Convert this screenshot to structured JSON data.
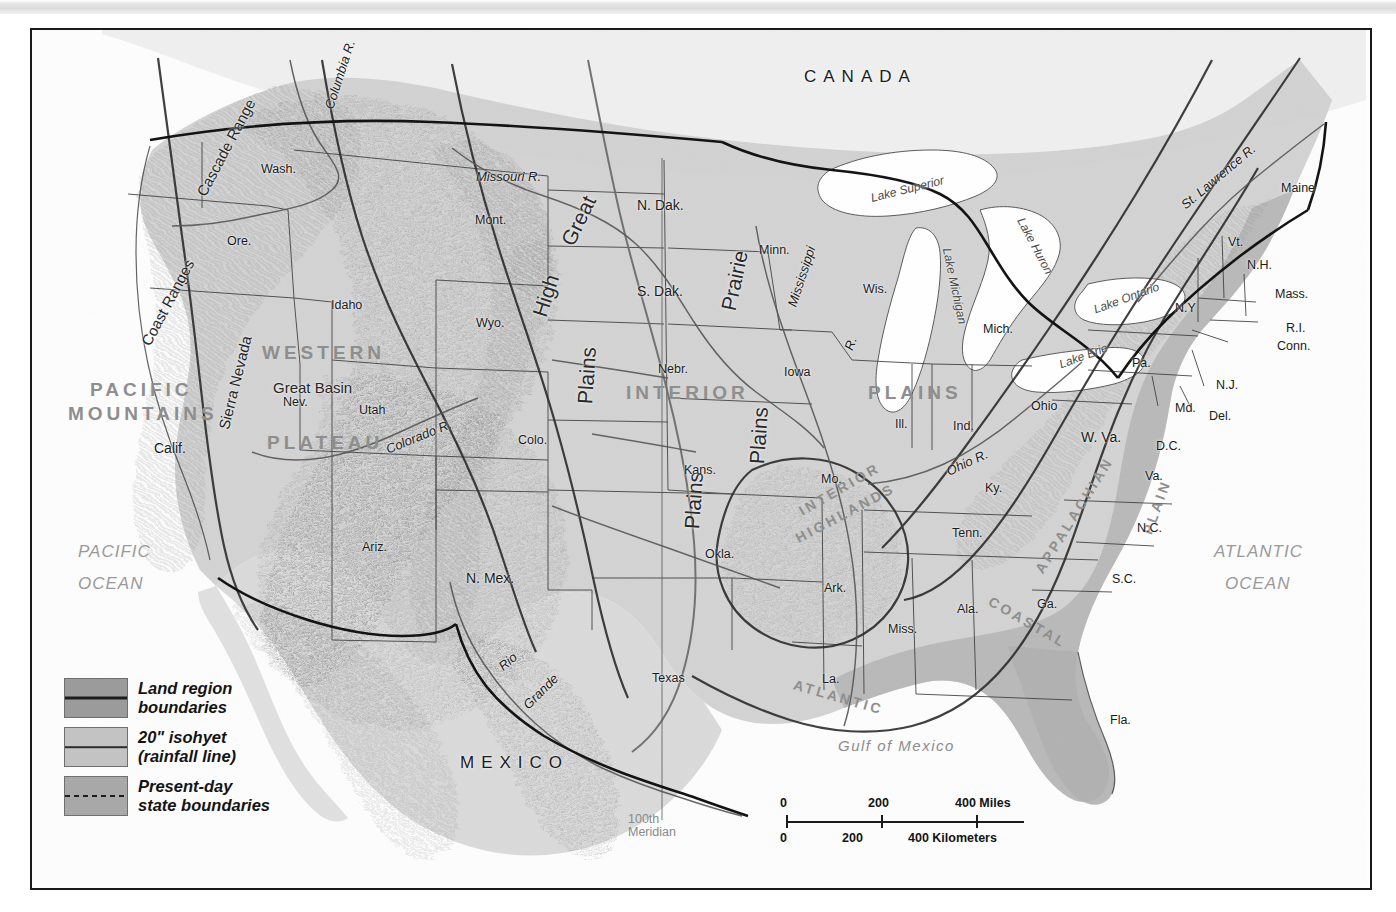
{
  "map": {
    "title": "Physical and Political Map of the United States",
    "countries": [
      {
        "name": "CANADA",
        "x": 772,
        "y": 38
      },
      {
        "name": "MEXICO",
        "x": 428,
        "y": 724
      }
    ],
    "oceans": [
      {
        "name": "PACIFIC",
        "x": 46,
        "y": 513
      },
      {
        "name": "OCEAN",
        "x": 46,
        "y": 545
      },
      {
        "name": "ATLANTIC",
        "x": 1182,
        "y": 513
      },
      {
        "name": "OCEAN",
        "x": 1193,
        "y": 545
      }
    ],
    "gulf": {
      "name": "Gulf of Mexico",
      "x": 806,
      "y": 708
    },
    "land_regions": [
      {
        "name": "PACIFIC",
        "x": 58,
        "y": 350
      },
      {
        "name": "MOUNTAINS",
        "x": 36,
        "y": 374
      },
      {
        "name": "WESTERN",
        "x": 230,
        "y": 313
      },
      {
        "name": "PLATEAU",
        "x": 235,
        "y": 403
      },
      {
        "name": "INTERIOR",
        "x": 594,
        "y": 353
      },
      {
        "name": "PLAINS",
        "x": 836,
        "y": 353
      },
      {
        "name": "INTERIOR",
        "x": 762,
        "y": 452
      },
      {
        "name": "HIGHLANDS",
        "x": 758,
        "y": 476
      },
      {
        "name": "APPALACHIAN",
        "x": 975,
        "y": 478
      },
      {
        "name": "ATLANTIC",
        "x": 760,
        "y": 660
      },
      {
        "name": "COASTAL",
        "x": 952,
        "y": 585
      },
      {
        "name": "PLAIN",
        "x": 1096,
        "y": 470
      }
    ],
    "physical_features": [
      {
        "name": "Great Basin",
        "x": 241,
        "y": 350
      },
      {
        "name": "Coast Ranges",
        "x": 88,
        "y": 265
      },
      {
        "name": "Cascade Range",
        "x": 140,
        "y": 110
      },
      {
        "name": "Sierra Nevada",
        "x": 155,
        "y": 345
      },
      {
        "name": "High",
        "x": 492,
        "y": 255
      },
      {
        "name": "Great",
        "x": 520,
        "y": 180
      },
      {
        "name": "Prairie",
        "x": 672,
        "y": 240
      },
      {
        "name": "Plains",
        "x": 526,
        "y": 335
      },
      {
        "name": "Plains",
        "x": 698,
        "y": 395
      },
      {
        "name": "Plains",
        "x": 633,
        "y": 460
      }
    ],
    "rivers": [
      {
        "name": "Columbia R.",
        "x": 272,
        "y": 38
      },
      {
        "name": "Missouri R.",
        "x": 444,
        "y": 140
      },
      {
        "name": "Mississippi",
        "x": 738,
        "y": 240
      },
      {
        "name": "R.",
        "x": 812,
        "y": 307
      },
      {
        "name": "Ohio R.",
        "x": 913,
        "y": 426
      },
      {
        "name": "Colorado R.",
        "x": 352,
        "y": 400
      },
      {
        "name": "Rio",
        "x": 466,
        "y": 625
      },
      {
        "name": "Grande",
        "x": 487,
        "y": 655
      },
      {
        "name": "St. Lawrence R.",
        "x": 1140,
        "y": 140
      }
    ],
    "lakes": [
      {
        "name": "Lake Superior",
        "x": 838,
        "y": 153
      },
      {
        "name": "Lake Michigan",
        "x": 884,
        "y": 250
      },
      {
        "name": "Lake Huron",
        "x": 972,
        "y": 210
      },
      {
        "name": "Lake Erie",
        "x": 1026,
        "y": 320
      },
      {
        "name": "Lake Ontario",
        "x": 1060,
        "y": 262
      }
    ],
    "states": [
      {
        "name": "Wash.",
        "x": 229,
        "y": 133
      },
      {
        "name": "Ore.",
        "x": 195,
        "y": 205
      },
      {
        "name": "Calif.",
        "x": 122,
        "y": 411
      },
      {
        "name": "Idaho",
        "x": 299,
        "y": 269
      },
      {
        "name": "Mont.",
        "x": 443,
        "y": 184
      },
      {
        "name": "Wyo.",
        "x": 444,
        "y": 287
      },
      {
        "name": "Nev.",
        "x": 251,
        "y": 366
      },
      {
        "name": "Utah",
        "x": 327,
        "y": 374
      },
      {
        "name": "Ariz.",
        "x": 330,
        "y": 511
      },
      {
        "name": "N. Mex.",
        "x": 434,
        "y": 541
      },
      {
        "name": "Colo.",
        "x": 486,
        "y": 404
      },
      {
        "name": "N. Dak.",
        "x": 605,
        "y": 168
      },
      {
        "name": "S. Dak.",
        "x": 605,
        "y": 254
      },
      {
        "name": "Nebr.",
        "x": 626,
        "y": 333
      },
      {
        "name": "Kans.",
        "x": 652,
        "y": 434
      },
      {
        "name": "Okla.",
        "x": 673,
        "y": 518
      },
      {
        "name": "Texas",
        "x": 620,
        "y": 642
      },
      {
        "name": "Minn.",
        "x": 727,
        "y": 214
      },
      {
        "name": "Iowa",
        "x": 752,
        "y": 336
      },
      {
        "name": "Mo.",
        "x": 789,
        "y": 443
      },
      {
        "name": "Ark.",
        "x": 792,
        "y": 552
      },
      {
        "name": "La.",
        "x": 790,
        "y": 643
      },
      {
        "name": "Wis.",
        "x": 831,
        "y": 253
      },
      {
        "name": "Ill.",
        "x": 863,
        "y": 388
      },
      {
        "name": "Miss.",
        "x": 856,
        "y": 593
      },
      {
        "name": "Mich.",
        "x": 951,
        "y": 293
      },
      {
        "name": "Ind.",
        "x": 921,
        "y": 390
      },
      {
        "name": "Ohio",
        "x": 999,
        "y": 370
      },
      {
        "name": "Ky.",
        "x": 953,
        "y": 452
      },
      {
        "name": "Tenn.",
        "x": 920,
        "y": 497
      },
      {
        "name": "Ala.",
        "x": 925,
        "y": 573
      },
      {
        "name": "Ga.",
        "x": 1005,
        "y": 568
      },
      {
        "name": "Fla.",
        "x": 1078,
        "y": 684
      },
      {
        "name": "S.C.",
        "x": 1080,
        "y": 543
      },
      {
        "name": "N.C.",
        "x": 1105,
        "y": 492
      },
      {
        "name": "Va.",
        "x": 1113,
        "y": 440
      },
      {
        "name": "W. Va.",
        "x": 1049,
        "y": 400
      },
      {
        "name": "D.C.",
        "x": 1124,
        "y": 410
      },
      {
        "name": "Md.",
        "x": 1143,
        "y": 372
      },
      {
        "name": "Del.",
        "x": 1177,
        "y": 380
      },
      {
        "name": "N.J.",
        "x": 1184,
        "y": 349
      },
      {
        "name": "Pa.",
        "x": 1100,
        "y": 327
      },
      {
        "name": "N.Y",
        "x": 1143,
        "y": 272
      },
      {
        "name": "Conn.",
        "x": 1245,
        "y": 310
      },
      {
        "name": "R.I.",
        "x": 1254,
        "y": 292
      },
      {
        "name": "Mass.",
        "x": 1243,
        "y": 258
      },
      {
        "name": "Vt.",
        "x": 1196,
        "y": 206
      },
      {
        "name": "N.H.",
        "x": 1215,
        "y": 229
      },
      {
        "name": "Maine",
        "x": 1249,
        "y": 152
      }
    ],
    "meridian": {
      "line1": "100th",
      "line2": "Meridian",
      "x": 596,
      "y": 783
    }
  },
  "legend": {
    "items": [
      {
        "label_line1": "Land region",
        "label_line2": "boundaries",
        "swatch": "sw-a",
        "bar": "bar-solid",
        "color": "#9b9b9b"
      },
      {
        "label_line1": "20\" isohyet",
        "label_line2": "(rainfall line)",
        "swatch": "sw-b",
        "bar": "bar-thin",
        "color": "#c3c3c3"
      },
      {
        "label_line1": "Present-day",
        "label_line2": "state boundaries",
        "swatch": "sw-c",
        "bar": "bar-dash",
        "color": "#a8a8a8"
      }
    ]
  },
  "scale": {
    "miles": {
      "start": "0",
      "mid": "200",
      "end": "400 Miles"
    },
    "kilometers": {
      "start": "0",
      "mid": "200",
      "end": "400 Kilometers"
    }
  }
}
